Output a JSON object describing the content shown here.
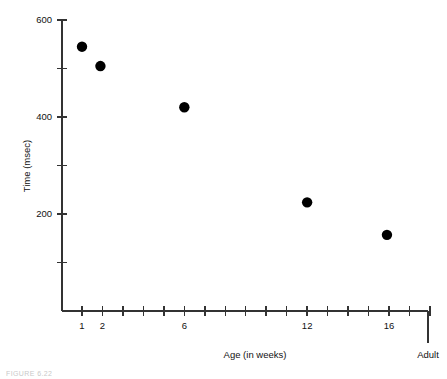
{
  "figure": {
    "caption_partial": "FIGURE 6.22"
  },
  "chart_data": {
    "type": "scatter",
    "title": "",
    "xlabel": "Age (in weeks)",
    "ylabel": "Time (msec)",
    "xlim": [
      0,
      19
    ],
    "ylim": [
      0,
      600
    ],
    "grid": false,
    "legend": null,
    "y_ticks": [
      100,
      200,
      300,
      400,
      500,
      600
    ],
    "y_tick_labels": [
      "",
      "200",
      "",
      "400",
      "",
      "600"
    ],
    "x_ticks": [
      1,
      2,
      3,
      4,
      5,
      6,
      7,
      8,
      9,
      10,
      11,
      12,
      13,
      14,
      15,
      16,
      17,
      18
    ],
    "x_tick_labels": [
      "1",
      "2",
      "",
      "",
      "",
      "6",
      "",
      "",
      "",
      "",
      "",
      "12",
      "",
      "",
      "",
      "16",
      "",
      ""
    ],
    "x_extra_tick": {
      "label": "Adult",
      "position": 19.4
    },
    "points": [
      {
        "x": 1,
        "y": 545,
        "label": "1 week"
      },
      {
        "x": 1.9,
        "y": 505,
        "label": "2 weeks"
      },
      {
        "x": 6,
        "y": 420,
        "label": "6 weeks"
      },
      {
        "x": 12,
        "y": 224,
        "label": "12 weeks"
      },
      {
        "x": 15.9,
        "y": 157,
        "label": "16 weeks"
      },
      {
        "x": 19.4,
        "y": 112,
        "label": "Adult"
      }
    ],
    "marker": {
      "shape": "circle",
      "size": 5.2,
      "color": "#000000"
    }
  }
}
